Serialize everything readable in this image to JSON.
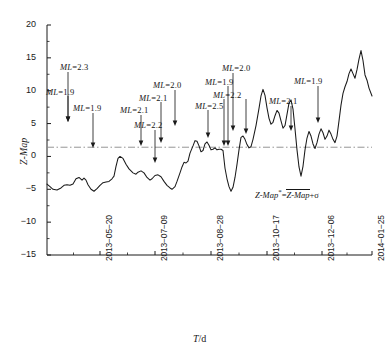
{
  "chart_data": {
    "type": "line",
    "title": "",
    "xlabel": "T/d",
    "ylabel": "Z-Map",
    "ylim": [
      -15,
      20
    ],
    "yticks": [
      20,
      15,
      10,
      5,
      0,
      -5,
      -10,
      -15
    ],
    "xtick_labels": [
      "2013-05-20",
      "2013-07-09",
      "2013-08-28",
      "2013-10-17",
      "2013-12-06",
      "2014-01-25"
    ],
    "xtick_positions_px": [
      100,
      155,
      211,
      267,
      322,
      372
    ],
    "grid": false,
    "legend": "none",
    "threshold_line": {
      "value": 1.4,
      "style": "dash-dot",
      "label": "Z-Map* = mean(Z-Map) + sigma"
    },
    "series": [
      {
        "name": "Z-Map",
        "color": "#1a1a1a",
        "points": [
          [
            47,
            -4.2
          ],
          [
            50,
            -4.6
          ],
          [
            53,
            -5.0
          ],
          [
            57,
            -5.1
          ],
          [
            61,
            -4.8
          ],
          [
            64,
            -4.4
          ],
          [
            67,
            -4.3
          ],
          [
            70,
            -4.4
          ],
          [
            73,
            -4.2
          ],
          [
            76,
            -3.4
          ],
          [
            79,
            -3.2
          ],
          [
            82,
            -3.6
          ],
          [
            84,
            -3.3
          ],
          [
            86,
            -3.6
          ],
          [
            88,
            -4.3
          ],
          [
            91,
            -5.0
          ],
          [
            94,
            -5.3
          ],
          [
            97,
            -4.9
          ],
          [
            100,
            -4.4
          ],
          [
            103,
            -4.0
          ],
          [
            106,
            -3.9
          ],
          [
            109,
            -3.8
          ],
          [
            112,
            -3.4
          ],
          [
            114,
            -3.0
          ],
          [
            116,
            -1.5
          ],
          [
            118,
            -0.3
          ],
          [
            120,
            0.0
          ],
          [
            123,
            -0.3
          ],
          [
            126,
            -1.2
          ],
          [
            129,
            -1.9
          ],
          [
            131,
            -2.2
          ],
          [
            133,
            -2.5
          ],
          [
            136,
            -2.7
          ],
          [
            138,
            -2.4
          ],
          [
            141,
            -2.2
          ],
          [
            144,
            -2.5
          ],
          [
            147,
            -3.2
          ],
          [
            150,
            -3.6
          ],
          [
            152,
            -3.4
          ],
          [
            155,
            -2.9
          ],
          [
            158,
            -2.8
          ],
          [
            161,
            -3.1
          ],
          [
            164,
            -3.8
          ],
          [
            167,
            -4.4
          ],
          [
            170,
            -4.8
          ],
          [
            172,
            -5.0
          ],
          [
            175,
            -4.6
          ],
          [
            177,
            -3.8
          ],
          [
            180,
            -2.5
          ],
          [
            182,
            -1.6
          ],
          [
            184,
            -0.9
          ],
          [
            186,
            -1.0
          ],
          [
            188,
            -0.7
          ],
          [
            190,
            0.5
          ],
          [
            193,
            1.6
          ],
          [
            195,
            2.4
          ],
          [
            197,
            2.3
          ],
          [
            199,
            1.6
          ],
          [
            201,
            0.7
          ],
          [
            203,
            0.9
          ],
          [
            205,
            1.9
          ],
          [
            207,
            2.2
          ],
          [
            209,
            1.7
          ],
          [
            211,
            1.0
          ],
          [
            213,
            1.1
          ],
          [
            215,
            1.3
          ],
          [
            217,
            1.0
          ],
          [
            219,
            1.1
          ],
          [
            221,
            1.1
          ],
          [
            223,
            0.9
          ],
          [
            225,
            -1.8
          ],
          [
            227,
            -3.4
          ],
          [
            229,
            -4.6
          ],
          [
            231,
            -5.3
          ],
          [
            233,
            -4.7
          ],
          [
            235,
            -3.2
          ],
          [
            237,
            -1.2
          ],
          [
            239,
            1.0
          ],
          [
            241,
            2.9
          ],
          [
            243,
            3.1
          ],
          [
            245,
            2.6
          ],
          [
            247,
            1.8
          ],
          [
            249,
            1.3
          ],
          [
            251,
            1.5
          ],
          [
            253,
            2.6
          ],
          [
            256,
            4.7
          ],
          [
            259,
            7.3
          ],
          [
            261,
            9.2
          ],
          [
            263,
            10.2
          ],
          [
            265,
            9.3
          ],
          [
            267,
            7.4
          ],
          [
            269,
            5.8
          ],
          [
            271,
            4.9
          ],
          [
            273,
            5.2
          ],
          [
            275,
            6.2
          ],
          [
            277,
            7.0
          ],
          [
            279,
            6.6
          ],
          [
            281,
            5.4
          ],
          [
            283,
            4.3
          ],
          [
            285,
            4.7
          ],
          [
            287,
            6.4
          ],
          [
            289,
            8.1
          ],
          [
            291,
            8.6
          ],
          [
            293,
            7.2
          ],
          [
            295,
            4.2
          ],
          [
            297,
            1.0
          ],
          [
            299,
            -1.6
          ],
          [
            301,
            -3.0
          ],
          [
            303,
            -1.5
          ],
          [
            305,
            1.0
          ],
          [
            307,
            2.8
          ],
          [
            309,
            3.8
          ],
          [
            311,
            3.1
          ],
          [
            313,
            1.9
          ],
          [
            315,
            1.2
          ],
          [
            317,
            2.1
          ],
          [
            319,
            3.4
          ],
          [
            321,
            4.2
          ],
          [
            323,
            3.6
          ],
          [
            325,
            2.6
          ],
          [
            327,
            3.1
          ],
          [
            329,
            4.0
          ],
          [
            331,
            3.4
          ],
          [
            333,
            2.6
          ],
          [
            335,
            2.1
          ],
          [
            337,
            3.1
          ],
          [
            339,
            5.4
          ],
          [
            341,
            7.8
          ],
          [
            343,
            9.6
          ],
          [
            345,
            10.6
          ],
          [
            347,
            11.4
          ],
          [
            349,
            12.6
          ],
          [
            351,
            13.3
          ],
          [
            353,
            12.6
          ],
          [
            355,
            11.9
          ],
          [
            357,
            13.2
          ],
          [
            359,
            14.8
          ],
          [
            361,
            16.1
          ],
          [
            363,
            14.6
          ],
          [
            365,
            12.4
          ],
          [
            367,
            11.6
          ],
          [
            369,
            10.4
          ],
          [
            372,
            9.2
          ]
        ]
      }
    ],
    "annotations": [
      {
        "id": "a1",
        "text": "ML=2.3",
        "magnitude": 2.3,
        "label_x": 60,
        "label_y": 62,
        "arrow_x": 68,
        "arrow_top": 72,
        "arrow_tip": 122
      },
      {
        "id": "a2",
        "text": "ML=1.9",
        "magnitude": 1.9,
        "label_x": 46,
        "label_y": 87,
        "arrow_x": 68,
        "arrow_top": 96,
        "arrow_tip": 122
      },
      {
        "id": "a3",
        "text": "ML=1.9",
        "magnitude": 1.9,
        "label_x": 73,
        "label_y": 103,
        "arrow_x": 93,
        "arrow_top": 113,
        "arrow_tip": 148
      },
      {
        "id": "a4",
        "text": "ML=2.1",
        "magnitude": 2.1,
        "label_x": 120,
        "label_y": 105,
        "arrow_x": 141,
        "arrow_top": 115,
        "arrow_tip": 146
      },
      {
        "id": "a5",
        "text": "ML=2.2",
        "magnitude": 2.2,
        "label_x": 134,
        "label_y": 120,
        "arrow_x": 155,
        "arrow_top": 130,
        "arrow_tip": 163
      },
      {
        "id": "a6",
        "text": "ML=2.1",
        "magnitude": 2.1,
        "label_x": 139,
        "label_y": 93,
        "arrow_x": 161,
        "arrow_top": 102,
        "arrow_tip": 143
      },
      {
        "id": "a7",
        "text": "ML=2.0",
        "magnitude": 2.0,
        "label_x": 153,
        "label_y": 80,
        "arrow_x": 175,
        "arrow_top": 90,
        "arrow_tip": 126
      },
      {
        "id": "a8",
        "text": "ML=2.5",
        "magnitude": 2.5,
        "label_x": 195,
        "label_y": 101,
        "arrow_x": 208,
        "arrow_top": 110,
        "arrow_tip": 138
      },
      {
        "id": "a9",
        "text": "ML=2.2",
        "magnitude": 2.2,
        "label_x": 213,
        "label_y": 90,
        "arrow_x": 224,
        "arrow_top": 99,
        "arrow_tip": 146
      },
      {
        "id": "a10",
        "text": "ML=1.9",
        "magnitude": 1.9,
        "label_x": 205,
        "label_y": 77,
        "arrow_x": 228,
        "arrow_top": 86,
        "arrow_tip": 146
      },
      {
        "id": "a11",
        "text": "ML=2.0",
        "magnitude": 2.0,
        "label_x": 222,
        "label_y": 63,
        "arrow_x": 233,
        "arrow_top": 73,
        "arrow_tip": 131
      },
      {
        "id": "a12",
        "text": "",
        "magnitude": null,
        "label_x": 0,
        "label_y": 0,
        "arrow_x": 246,
        "arrow_top": 99,
        "arrow_tip": 134
      },
      {
        "id": "a13",
        "text": "ML=2.1",
        "magnitude": 2.1,
        "label_x": 269,
        "label_y": 96,
        "arrow_x": 291,
        "arrow_top": 106,
        "arrow_tip": 131
      },
      {
        "id": "a14",
        "text": "ML=1.9",
        "magnitude": 1.9,
        "label_x": 294,
        "label_y": 76,
        "arrow_x": 318,
        "arrow_top": 86,
        "arrow_tip": 123
      }
    ]
  },
  "axes": {
    "x_axis_px": {
      "left": 47,
      "right": 372,
      "baseline_y": 255
    },
    "y_axis_px": {
      "top": 25,
      "bottom": 255
    },
    "y_label": "Z-Map",
    "x_label_prefix": "T",
    "x_label_suffix": "/d"
  },
  "formula": {
    "lhs": "Z-Map",
    "star": "*",
    "eq": "=",
    "overline": "Z-Map",
    "plus_sigma": "+σ",
    "x_px": 255,
    "y_px": 188
  }
}
